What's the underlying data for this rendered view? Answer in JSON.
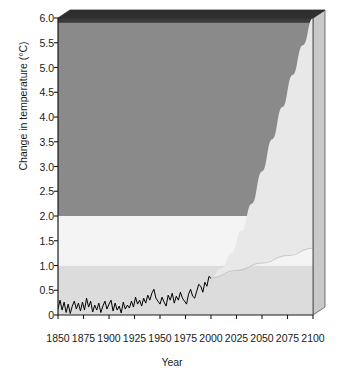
{
  "chart_data": {
    "type": "line",
    "title": "",
    "xlabel": "Year",
    "ylabel": "Change in temperature (°C)",
    "xlim": [
      1850,
      2100
    ],
    "ylim": [
      0,
      6.0
    ],
    "xticks": [
      1850,
      1875,
      1900,
      1925,
      1950,
      1975,
      2000,
      2025,
      2050,
      2075,
      2100
    ],
    "xtick_labels": [
      "1850",
      "1875",
      "1900",
      "1925",
      "1950",
      "1975",
      "2000",
      "2025",
      "2050",
      "2075",
      "2100"
    ],
    "yticks": [
      0,
      0.5,
      1.0,
      1.5,
      2.0,
      2.5,
      3.0,
      3.5,
      4.0,
      4.5,
      5.0,
      5.5,
      6.0
    ],
    "ytick_labels": [
      "0",
      "0.5",
      "1.0",
      "1.5",
      "2.0",
      "2.5",
      "3.0",
      "3.5",
      "4.0",
      "4.5",
      "5.0",
      "5.5",
      "6.0"
    ],
    "grid": false,
    "legend": "none",
    "background_bands": [
      {
        "name": "lower-band",
        "from": 0.0,
        "to": 1.0,
        "color": "#dcdcdc"
      },
      {
        "name": "middle-band",
        "from": 1.0,
        "to": 2.0,
        "color": "#f4f4f4"
      },
      {
        "name": "upper-band",
        "from": 2.0,
        "to": 5.9,
        "color": "#8a8a8a"
      },
      {
        "name": "top-band",
        "from": 5.9,
        "to": 6.0,
        "color": "#3a3a3a"
      }
    ],
    "projection_wedge": {
      "name": "projection-envelope",
      "color": "#e8e8e8",
      "start_year": 2000,
      "start_value": 0.75,
      "upper_bound": [
        {
          "year": 2000,
          "value": 0.75
        },
        {
          "year": 2010,
          "value": 0.95
        },
        {
          "year": 2020,
          "value": 1.25
        },
        {
          "year": 2030,
          "value": 1.7
        },
        {
          "year": 2040,
          "value": 2.25
        },
        {
          "year": 2050,
          "value": 2.9
        },
        {
          "year": 2060,
          "value": 3.55
        },
        {
          "year": 2070,
          "value": 4.2
        },
        {
          "year": 2080,
          "value": 4.85
        },
        {
          "year": 2090,
          "value": 5.45
        },
        {
          "year": 2100,
          "value": 6.0
        }
      ],
      "lower_bound": [
        {
          "year": 2000,
          "value": 0.75
        },
        {
          "year": 2025,
          "value": 0.9
        },
        {
          "year": 2050,
          "value": 1.05
        },
        {
          "year": 2075,
          "value": 1.2
        },
        {
          "year": 2100,
          "value": 1.35
        }
      ]
    },
    "series": [
      {
        "name": "observed-temperature",
        "label": "Observed change in temperature",
        "color": "#000000",
        "x": [
          1850,
          1852,
          1854,
          1856,
          1858,
          1860,
          1862,
          1864,
          1866,
          1868,
          1870,
          1872,
          1874,
          1876,
          1878,
          1880,
          1882,
          1884,
          1886,
          1888,
          1890,
          1892,
          1894,
          1896,
          1898,
          1900,
          1902,
          1904,
          1906,
          1908,
          1910,
          1912,
          1914,
          1916,
          1918,
          1920,
          1922,
          1924,
          1926,
          1928,
          1930,
          1932,
          1934,
          1936,
          1938,
          1940,
          1942,
          1944,
          1946,
          1948,
          1950,
          1952,
          1954,
          1956,
          1958,
          1960,
          1962,
          1964,
          1966,
          1968,
          1970,
          1972,
          1974,
          1976,
          1978,
          1980,
          1982,
          1984,
          1986,
          1988,
          1990,
          1992,
          1994,
          1996,
          1998,
          2000
        ],
        "values": [
          0.12,
          0.3,
          0.1,
          0.26,
          0.05,
          0.22,
          0.03,
          0.18,
          0.28,
          0.12,
          0.24,
          0.08,
          0.26,
          0.1,
          0.34,
          0.16,
          0.28,
          0.06,
          0.2,
          0.1,
          0.24,
          0.05,
          0.18,
          0.28,
          0.12,
          0.22,
          0.3,
          0.08,
          0.24,
          0.1,
          0.18,
          0.04,
          0.26,
          0.12,
          0.2,
          0.14,
          0.28,
          0.16,
          0.36,
          0.22,
          0.3,
          0.18,
          0.34,
          0.24,
          0.4,
          0.3,
          0.44,
          0.52,
          0.34,
          0.28,
          0.22,
          0.36,
          0.26,
          0.18,
          0.4,
          0.3,
          0.44,
          0.24,
          0.38,
          0.3,
          0.46,
          0.34,
          0.28,
          0.22,
          0.42,
          0.52,
          0.38,
          0.34,
          0.48,
          0.62,
          0.58,
          0.46,
          0.66,
          0.58,
          0.78,
          0.74
        ]
      }
    ]
  },
  "axes": {
    "ylabel": "Change in temperature (°C)",
    "xlabel": "Year"
  }
}
